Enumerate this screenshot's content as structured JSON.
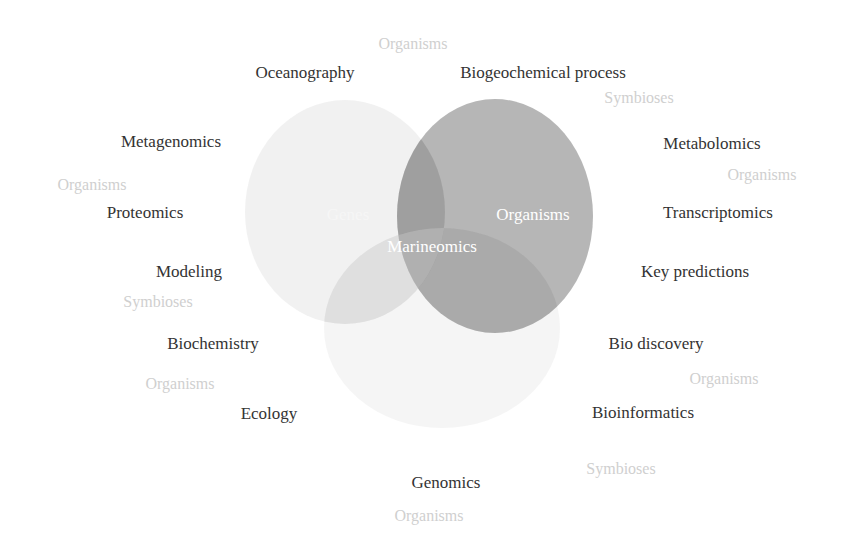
{
  "diagram": {
    "type": "venn",
    "colors": {
      "background": "#ffffff",
      "topic_text": "#333333",
      "ghost_text": "#cfcfcf",
      "circle_label_text": "#ffffff",
      "circle_left": "#eeeeee",
      "circle_right": "#a9a9a9",
      "circle_bottom": "#f4f4f4"
    },
    "circles": [
      {
        "label": "Genes",
        "position": "left",
        "cx": 345,
        "cy": 212,
        "rx": 100,
        "ry": 112
      },
      {
        "label": "Organisms",
        "position": "right",
        "cx": 495,
        "cy": 216,
        "rx": 98,
        "ry": 117
      },
      {
        "label": "Environment",
        "position": "bottom",
        "cx": 442,
        "cy": 328,
        "rx": 118,
        "ry": 100
      }
    ],
    "center_label": "Marineomics",
    "topics": [
      {
        "text": "Oceanography",
        "x": 305,
        "y": 72
      },
      {
        "text": "Biogeochemical process",
        "x": 543,
        "y": 72
      },
      {
        "text": "Metagenomics",
        "x": 171,
        "y": 141
      },
      {
        "text": "Metabolomics",
        "x": 712,
        "y": 143
      },
      {
        "text": "Proteomics",
        "x": 145,
        "y": 212
      },
      {
        "text": "Transcriptomics",
        "x": 718,
        "y": 212
      },
      {
        "text": "Modeling",
        "x": 189,
        "y": 271
      },
      {
        "text": "Key predictions",
        "x": 695,
        "y": 271
      },
      {
        "text": "Biochemistry",
        "x": 213,
        "y": 343
      },
      {
        "text": "Bio discovery",
        "x": 656,
        "y": 343
      },
      {
        "text": "Ecology",
        "x": 269,
        "y": 413
      },
      {
        "text": "Bioinformatics",
        "x": 643,
        "y": 412
      },
      {
        "text": "Genomics",
        "x": 446,
        "y": 482
      }
    ],
    "ghost_labels": [
      {
        "text": "Organisms",
        "x": 413,
        "y": 44
      },
      {
        "text": "Symbioses",
        "x": 639,
        "y": 98
      },
      {
        "text": "Organisms",
        "x": 92,
        "y": 185
      },
      {
        "text": "Organisms",
        "x": 762,
        "y": 175
      },
      {
        "text": "Symbioses",
        "x": 158,
        "y": 302
      },
      {
        "text": "Organisms",
        "x": 180,
        "y": 384
      },
      {
        "text": "Organisms",
        "x": 724,
        "y": 379
      },
      {
        "text": "Symbioses",
        "x": 621,
        "y": 469
      },
      {
        "text": "Organisms",
        "x": 429,
        "y": 516
      }
    ]
  }
}
